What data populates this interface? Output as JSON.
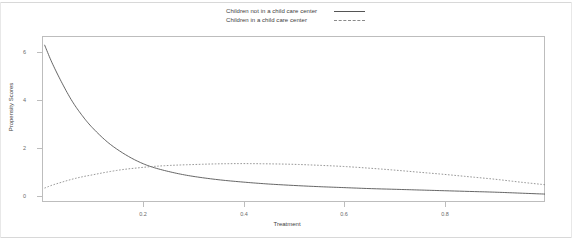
{
  "chart_data": {
    "type": "line",
    "title": "",
    "subtitle": "",
    "xlabel": "Treatment",
    "ylabel": "Propensity Scores",
    "xlim": [
      0.0,
      1.0
    ],
    "ylim": [
      0.0,
      6.5
    ],
    "grid": false,
    "legend_position": "top-center",
    "xticks": [
      "0.2",
      "0.4",
      "0.6",
      "0.8"
    ],
    "xtick_values": [
      0.2,
      0.4,
      0.6,
      0.8
    ],
    "yticks": [
      "0",
      "2",
      "4",
      "6"
    ],
    "ytick_values": [
      0,
      2,
      4,
      6
    ],
    "series": [
      {
        "name": "Children not in a child care center",
        "style": "solid",
        "color": "#555555",
        "x": [
          0.005,
          0.02,
          0.04,
          0.06,
          0.08,
          0.1,
          0.13,
          0.16,
          0.19,
          0.22,
          0.26,
          0.3,
          0.35,
          0.4,
          0.45,
          0.5,
          0.55,
          0.6,
          0.65,
          0.7,
          0.75,
          0.8,
          0.85,
          0.9,
          0.95,
          1.0
        ],
        "y": [
          6.3,
          5.55,
          4.7,
          3.95,
          3.35,
          2.85,
          2.25,
          1.8,
          1.45,
          1.2,
          0.98,
          0.82,
          0.68,
          0.58,
          0.5,
          0.44,
          0.39,
          0.35,
          0.31,
          0.28,
          0.25,
          0.22,
          0.19,
          0.16,
          0.12,
          0.08
        ]
      },
      {
        "name": "Children in a child care center",
        "style": "dotted",
        "color": "#8a8a8a",
        "x": [
          0.005,
          0.02,
          0.04,
          0.06,
          0.08,
          0.1,
          0.13,
          0.16,
          0.19,
          0.22,
          0.26,
          0.3,
          0.35,
          0.4,
          0.45,
          0.5,
          0.55,
          0.6,
          0.65,
          0.7,
          0.75,
          0.8,
          0.85,
          0.9,
          0.95,
          1.0
        ],
        "y": [
          0.33,
          0.45,
          0.58,
          0.7,
          0.8,
          0.88,
          1.0,
          1.1,
          1.17,
          1.23,
          1.28,
          1.31,
          1.34,
          1.35,
          1.34,
          1.32,
          1.28,
          1.23,
          1.16,
          1.08,
          0.99,
          0.9,
          0.8,
          0.7,
          0.58,
          0.47
        ]
      }
    ]
  },
  "legend": {
    "items": [
      {
        "label": "Children not in a child care center",
        "style": "solid"
      },
      {
        "label": "Children in a child care center",
        "style": "dotted"
      }
    ]
  },
  "axes": {
    "x_label": "Treatment",
    "y_label": "Propensity Scores",
    "x_ticks": [
      {
        "label": "0.2",
        "value": 0.2
      },
      {
        "label": "0.4",
        "value": 0.4
      },
      {
        "label": "0.6",
        "value": 0.6
      },
      {
        "label": "0.8",
        "value": 0.8
      }
    ],
    "y_ticks": [
      {
        "label": "6",
        "value": 6
      },
      {
        "label": "4",
        "value": 4
      },
      {
        "label": "2",
        "value": 2
      },
      {
        "label": "0",
        "value": 0
      }
    ]
  },
  "colors": {
    "series_solid": "#555555",
    "series_dotted": "#8a8a8a",
    "frame": "#bdbdbd",
    "text": "#3d3d3d",
    "tick_text": "#6a6a6a",
    "background": "#ffffff"
  }
}
